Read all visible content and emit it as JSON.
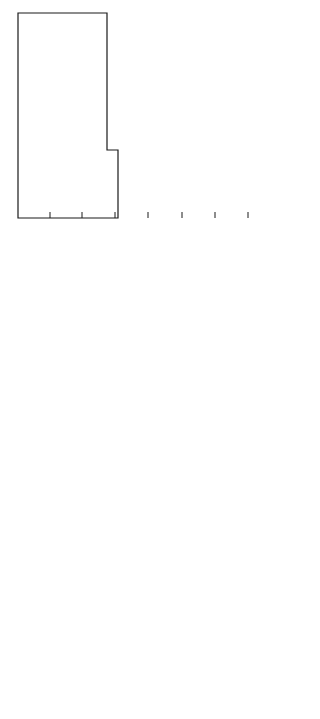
{
  "figure": {
    "orientation": "rotated 90 degrees clockwise (Z axis horizontal, R axis vertical)",
    "panels": [
      {
        "id": "tangential-velocity",
        "title": "vθ = 3.2 m/s",
        "quantity": "vθ",
        "z_ticks": [
          "8.0",
          "7.0",
          "6.0",
          "5.0",
          "4.0",
          "3.0",
          "2.0",
          "1.0",
          "0.0"
        ],
        "r_ticks_inner": [
          "0.0",
          "0.2",
          "0.4",
          "0.6",
          "0.8",
          "1.0"
        ],
        "r_ticks_outer": [
          "1.5",
          "2.0",
          "2.5",
          "3.0"
        ],
        "r_axis_label": "R →",
        "contour_labels": [
          "6.5",
          "9.8",
          "13.1",
          "16.4"
        ]
      },
      {
        "id": "temperature",
        "title": "T = 375 K",
        "quantity": "T",
        "z_ticks": [
          "8.0",
          "7.0",
          "6.0",
          "5.0",
          "4.0",
          "3.0",
          "2.0",
          "1.0",
          "0.0"
        ],
        "r_ticks_inner": [
          "0.0",
          "0.2",
          "0.4",
          "0.6",
          "0.8",
          "1.0"
        ],
        "r_ticks_outer": [
          "1.5",
          "2.0",
          "2.5",
          "3.0"
        ],
        "r_axis_label": "R →",
        "contour_labels": [
          "800",
          "2500",
          "5000",
          "7500",
          "9000",
          "10,000",
          "10,650"
        ]
      },
      {
        "id": "stream-function",
        "title": "ψ = 1.2",
        "quantity": "ψ",
        "z_ticks": [
          "8.0",
          "7.0",
          "6.0",
          "5.0",
          "4.0",
          "3.0",
          "2.0",
          "1.0",
          "0.0"
        ],
        "r_ticks_inner": [
          "0.0",
          "0.2",
          "0.4",
          "0.6",
          "0.8",
          "1.0"
        ],
        "r_ticks_outer": [
          "1.5",
          "2.0",
          "2.5",
          "3.0"
        ],
        "r_axis_label": "R →",
        "z_axis_label": "Z →",
        "contour_labels": [
          "1.0",
          "0.8",
          "0.6",
          "0.5",
          "0.3",
          "0.1",
          "0.05",
          "0.02",
          "0.01"
        ],
        "velocity_annotations": [
          "0.09 m/s",
          "4 m/s",
          "2 m/s"
        ]
      }
    ]
  }
}
